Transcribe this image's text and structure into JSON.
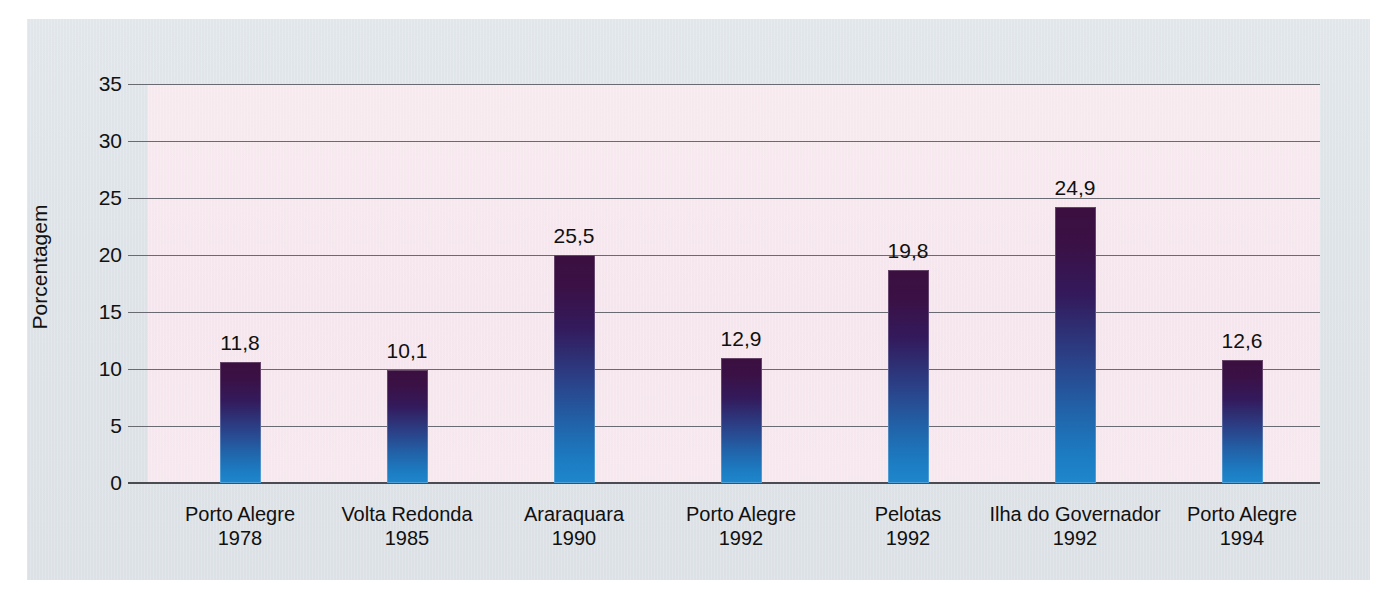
{
  "chart_data": {
    "type": "bar",
    "title": "",
    "xlabel": "",
    "ylabel": "Porcentagem",
    "ylim": [
      0,
      35
    ],
    "ytick_step": 5,
    "yticks": [
      "35",
      "30",
      "25",
      "20",
      "15",
      "10",
      "5",
      "0"
    ],
    "grid": true,
    "legend": "none",
    "decimal_separator": ",",
    "categories": [
      "Porto Alegre 1978",
      "Volta Redonda 1985",
      "Araraquara 1990",
      "Porto Alegre 1992",
      "Pelotas 1992",
      "Ilha do Governador 1992",
      "Porto Alegre 1994"
    ],
    "category_places": [
      "Porto Alegre",
      "Volta Redonda",
      "Araraquara",
      "Porto Alegre",
      "Pelotas",
      "Ilha do Governador",
      "Porto Alegre"
    ],
    "category_years": [
      "1978",
      "1985",
      "1990",
      "1992",
      "1992",
      "1992",
      "1994"
    ],
    "values": [
      11.8,
      10.1,
      25.5,
      12.9,
      19.8,
      24.9,
      12.6
    ],
    "value_labels": [
      "11,8",
      "10,1",
      "25,5",
      "12,9",
      "19,8",
      "24,9",
      "12,6"
    ],
    "bar_drawn_values": [
      10.6,
      9.9,
      20.0,
      11.0,
      18.7,
      24.2,
      10.8
    ]
  },
  "colors": {
    "page_background": "#ffffff",
    "panel_background": "#dde3e8",
    "plot_background": "#f7e8ee",
    "gridline": "#6a6a72",
    "axis": "#4b4b53",
    "bar_top": "#3b0f3f",
    "bar_mid": "#2b3f86",
    "bar_bottom": "#1f87cd",
    "text": "#101010"
  }
}
